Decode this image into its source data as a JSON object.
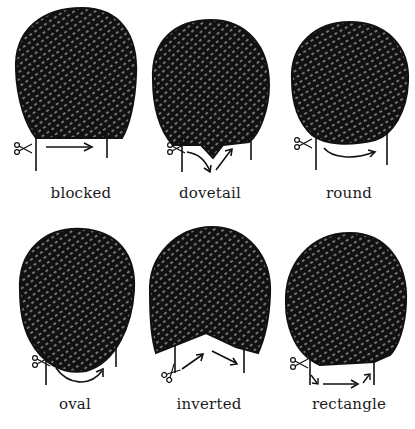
{
  "figure": {
    "colors": {
      "ink": "#111111",
      "background": "#ffffff"
    },
    "panels": [
      {
        "id": "blocked",
        "label": "blocked",
        "cut_path": "straight horizontal",
        "icons": [
          "scissors-icon",
          "arrow-right-icon"
        ]
      },
      {
        "id": "dovetail",
        "label": "dovetail",
        "cut_path": "V-shape down then up",
        "icons": [
          "scissors-icon",
          "arrow-down-icon",
          "arrow-up-icon"
        ]
      },
      {
        "id": "round",
        "label": "round",
        "cut_path": "shallow curve",
        "icons": [
          "scissors-icon",
          "curved-arrow-icon"
        ]
      },
      {
        "id": "oval",
        "label": "oval",
        "cut_path": "deep curve",
        "icons": [
          "scissors-icon",
          "curved-arrow-icon"
        ]
      },
      {
        "id": "inverted",
        "label": "inverted",
        "cut_path": "inverted V (up then down)",
        "icons": [
          "scissors-icon",
          "arrow-up-icon",
          "arrow-down-icon"
        ]
      },
      {
        "id": "rectangle",
        "label": "rectangle",
        "cut_path": "squared corners, straight across",
        "icons": [
          "scissors-icon",
          "arrow-right-icon"
        ]
      }
    ]
  }
}
